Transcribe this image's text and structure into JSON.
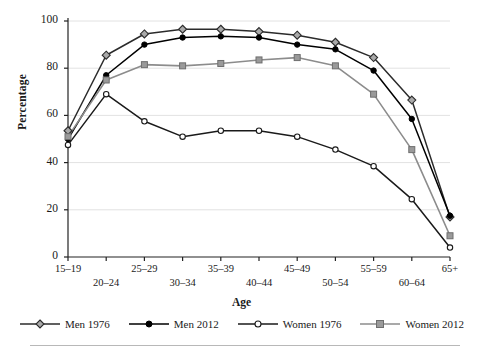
{
  "axes": {
    "ylabel": "Percentage",
    "xlabel": "Age",
    "yticks": [
      "0",
      "20",
      "40",
      "60",
      "80",
      "100"
    ],
    "xticks": [
      "15–19",
      "20–24",
      "25–29",
      "30–34",
      "35–39",
      "40–44",
      "45–49",
      "50–54",
      "55–59",
      "60–64",
      "65+"
    ]
  },
  "legend": {
    "items": [
      {
        "label": "Men 1976",
        "marker": "diamond-open-marker",
        "color": "#2b2b2b"
      },
      {
        "label": "Men 2012",
        "marker": "circle-filled-marker",
        "color": "#000000"
      },
      {
        "label": "Women 1976",
        "marker": "circle-open-marker",
        "color": "#1a1a1a"
      },
      {
        "label": "Women 2012",
        "marker": "square-filled-marker",
        "color": "#8c8c8c"
      }
    ]
  },
  "chart_data": {
    "type": "line",
    "title": "",
    "xlabel": "Age",
    "ylabel": "Percentage",
    "ylim": [
      0,
      100
    ],
    "grid": true,
    "legend_position": "bottom",
    "categories": [
      "15–19",
      "20–24",
      "25–29",
      "30–34",
      "35–39",
      "40–44",
      "45–49",
      "50–54",
      "55–59",
      "60–64",
      "65+"
    ],
    "series": [
      {
        "name": "Men 1976",
        "color": "#2b2b2b",
        "marker": "diamond-open-marker",
        "values": [
          53.5,
          85.5,
          94.5,
          96.5,
          96.5,
          95.5,
          94.0,
          91.0,
          84.5,
          66.5,
          17.0
        ]
      },
      {
        "name": "Men 2012",
        "color": "#000000",
        "marker": "circle-filled-marker",
        "values": [
          50.0,
          77.0,
          90.0,
          93.0,
          93.5,
          93.0,
          90.0,
          88.0,
          79.0,
          58.5,
          17.5
        ]
      },
      {
        "name": "Women 1976",
        "color": "#1a1a1a",
        "marker": "circle-open-marker",
        "values": [
          47.5,
          69.0,
          57.5,
          51.0,
          53.5,
          53.5,
          51.0,
          45.5,
          38.5,
          24.5,
          4.0
        ]
      },
      {
        "name": "Women 2012",
        "color": "#8c8c8c",
        "marker": "square-filled-marker",
        "values": [
          51.0,
          75.0,
          81.5,
          81.0,
          82.0,
          83.5,
          84.5,
          81.0,
          69.0,
          45.5,
          9.0
        ]
      }
    ]
  }
}
